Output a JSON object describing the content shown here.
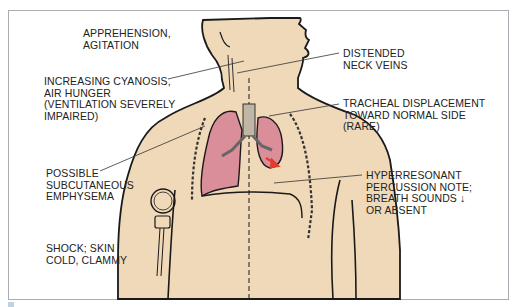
{
  "figure": {
    "labels": {
      "apprehension": [
        "APPREHENSION,",
        "AGITATION"
      ],
      "cyanosis": [
        "INCREASING CYANOSIS,",
        "AIR HUNGER",
        "(VENTILATION SEVERELY",
        "IMPAIRED)"
      ],
      "emphysema": [
        "POSSIBLE",
        "SUBCUTANEOUS",
        "EMPHYSEMA"
      ],
      "shock": [
        "SHOCK; SKIN",
        "COLD, CLAMMY"
      ],
      "neck_veins": [
        "DISTENDED",
        "NECK VEINS"
      ],
      "tracheal": [
        "TRACHEAL DISPLACEMENT",
        "TOWARD NORMAL SIDE",
        "(RARE)"
      ],
      "percussion": [
        "HYPERRESONANT",
        "PERCUSSION NOTE;",
        "BREATH SOUNDS ↓",
        "OR ABSENT"
      ]
    },
    "colors": {
      "skin": "#efd9b8",
      "lung": "#d98e9a",
      "outline": "#1a1a1a",
      "arrow": "#e53b2c",
      "frame": "#a9acb3",
      "caption_mark": "#bcd3e6"
    },
    "icons": {
      "blood_pressure_cuff": "bp-gauge-icon",
      "airflow_arrow": "red-arrow-icon"
    }
  }
}
